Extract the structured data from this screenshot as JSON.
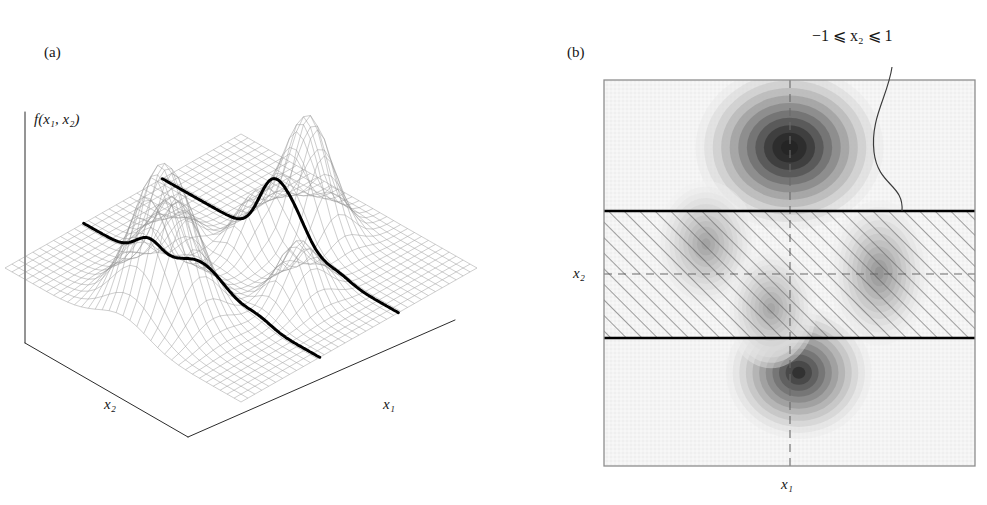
{
  "figure": {
    "panels": [
      {
        "tag": "(a)",
        "type": "3d-wireframe-surface",
        "vertical_axis_label": "f(x₁, x₂)",
        "axis_labels": {
          "left": "x₂",
          "right": "x₁"
        },
        "description": "Mesh surface of f over the (x1,x2) plane with two bold profile curves at x2 = -1 and x2 = +1"
      },
      {
        "tag": "(b)",
        "type": "grayscale-density-contour",
        "axis_labels": {
          "y": "x₂",
          "x": "x₁"
        },
        "annotation": "−1 ⩽ x₂ ⩽ 1",
        "hatched_band_label": "−1 ⩽ x₂ ⩽ 1",
        "description": "Top-down contour map; hatched horizontal band marks the feasible strip -1 <= x2 <= 1"
      }
    ]
  },
  "chart_data": {
    "type": "heatmap",
    "title": "",
    "subtitle": "",
    "xlabel": "x₁",
    "ylabel": "x₂",
    "xlim": [
      -3,
      3
    ],
    "ylim": [
      -3,
      3
    ],
    "grid": false,
    "legend": "none",
    "annotations": [
      {
        "text": "−1 ⩽ x₂ ⩽ 1",
        "points_to": "hatched band",
        "x": 2.6,
        "y": 3.55
      }
    ],
    "reference_lines": [
      {
        "orientation": "vertical",
        "value": 0,
        "style": "dashed",
        "label": "x₁ = 0"
      },
      {
        "orientation": "horizontal",
        "value": 0,
        "style": "dashed",
        "label": "x₂ = 0"
      },
      {
        "orientation": "horizontal",
        "value": 1,
        "style": "solid-bold",
        "label": "x₂ = 1"
      },
      {
        "orientation": "horizontal",
        "value": -1,
        "style": "solid-bold",
        "label": "x₂ = −1"
      }
    ],
    "shaded_region": {
      "type": "hatched-band",
      "y_from": -1,
      "y_to": 1,
      "hatch_angle_deg": 45
    },
    "peaks": [
      {
        "name": "global-peak-top",
        "x": 0.0,
        "y": 1.95,
        "amplitude": 1.0,
        "sigma_x": 0.62,
        "sigma_y": 0.52
      },
      {
        "name": "peak-bottom",
        "x": 0.15,
        "y": -1.55,
        "amplitude": 0.82,
        "sigma_x": 0.48,
        "sigma_y": 0.42
      },
      {
        "name": "peak-band-left",
        "x": -1.35,
        "y": 0.45,
        "amplitude": 0.34,
        "sigma_x": 0.33,
        "sigma_y": 0.4
      },
      {
        "name": "peak-band-right",
        "x": 1.45,
        "y": 0.0,
        "amplitude": 0.4,
        "sigma_x": 0.33,
        "sigma_y": 0.46
      },
      {
        "name": "peak-band-center",
        "x": -0.3,
        "y": -0.55,
        "amplitude": 0.33,
        "sigma_x": 0.3,
        "sigma_y": 0.38
      }
    ],
    "series": [
      {
        "name": "f(x1, x2) density",
        "values": [
          1.0,
          0.82,
          0.4,
          0.34,
          0.33
        ]
      }
    ],
    "categories": [
      "global-peak-top",
      "peak-bottom",
      "peak-band-right",
      "peak-band-left",
      "peak-band-center"
    ],
    "colors": {
      "background": "#f4f4f4",
      "contour_dark": "#3a3a3a",
      "contour_light": "#e2e2e2",
      "frame": "#8a8a8a",
      "bold_line": "#000000",
      "dashed_line": "#555555",
      "hatch": "#4a4a4a",
      "mesh": "#8c8c8c",
      "trace": "#000000"
    },
    "surface_traces": [
      {
        "name": "profile at x₂ = +1",
        "style": "bold-black"
      },
      {
        "name": "profile at x₂ = −1",
        "style": "bold-black"
      }
    ]
  }
}
